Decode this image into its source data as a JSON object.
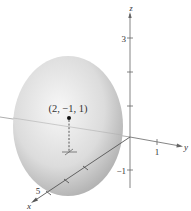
{
  "figure": {
    "type": "3d-ellipsoid",
    "point": {
      "label": "(2, −1, 1)",
      "coords": [
        2,
        -1,
        1
      ]
    },
    "axes": {
      "x": {
        "label": "x",
        "tick_label": "5"
      },
      "y": {
        "label": "y",
        "tick_label": "1"
      },
      "z": {
        "label": "z",
        "tick_labels": [
          "3",
          "−1"
        ]
      }
    },
    "colors": {
      "surface_light": "#f2f2f2",
      "surface_dark": "#8c8c8c",
      "axis": "#555555",
      "point": "#111111"
    }
  }
}
